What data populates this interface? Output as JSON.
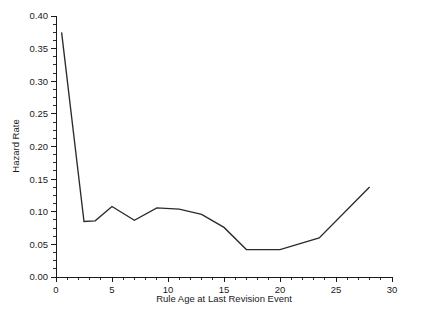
{
  "chart_data": {
    "type": "line",
    "title": "",
    "subtitle": "",
    "xlabel": "Rule Age at Last Revision Event",
    "ylabel": "Hazard Rate",
    "xlim": [
      0,
      30
    ],
    "ylim": [
      0.0,
      0.4
    ],
    "grid": false,
    "legend": false,
    "legend_position": "none",
    "line_color": "#2b2b2b",
    "x_major_ticks": [
      0,
      5,
      10,
      15,
      20,
      25,
      30
    ],
    "x_tick_labels": [
      "0",
      "5",
      "10",
      "15",
      "20",
      "25",
      "30"
    ],
    "x_minor_tick_interval": 1,
    "y_major_ticks": [
      0.0,
      0.05,
      0.1,
      0.15,
      0.2,
      0.25,
      0.3,
      0.35,
      0.4
    ],
    "y_tick_labels": [
      "0.00",
      "0.05",
      "0.10",
      "0.15",
      "0.20",
      "0.25",
      "0.30",
      "0.35",
      "0.40"
    ],
    "y_minor_tick_interval": 0.0125,
    "series": [
      {
        "name": "Hazard Rate",
        "x": [
          0.5,
          2.5,
          3.5,
          5.0,
          7.0,
          9.0,
          11.0,
          13.0,
          15.0,
          17.0,
          20.0,
          23.5,
          28.0
        ],
        "values": [
          0.375,
          0.085,
          0.086,
          0.108,
          0.087,
          0.106,
          0.104,
          0.096,
          0.076,
          0.042,
          0.042,
          0.06,
          0.138
        ]
      }
    ]
  }
}
